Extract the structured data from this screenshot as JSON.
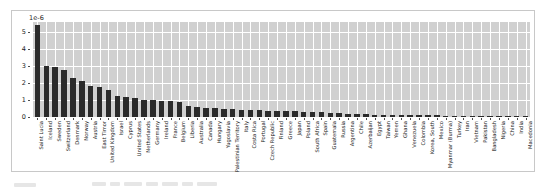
{
  "chart_data": {
    "type": "bar",
    "title": "",
    "xlabel": "",
    "ylabel": "",
    "exponent_label": "1e-6",
    "scale_factor": 1e-06,
    "ylim": [
      0,
      5.6
    ],
    "yticks": [
      0,
      1,
      2,
      3,
      4,
      5
    ],
    "ytick_labels": [
      "0",
      "1",
      "2",
      "3",
      "4",
      "5"
    ],
    "grid": true,
    "legend": "none",
    "categories": [
      "Saint Lucia",
      "Iceland",
      "Sweden",
      "Switzerland",
      "Denmark",
      "Norway",
      "Austria",
      "East Timor",
      "United Kingdom",
      "Israel",
      "Cyprus",
      "United States",
      "Netherlands",
      "Germany",
      "Ireland",
      "France",
      "Belgium",
      "Liberia",
      "Australia",
      "Canada",
      "Hungary",
      "Yugoslavia",
      "Palestinian Territory",
      "Italy",
      "Costa Rica",
      "Portugal",
      "Czech Republic",
      "Finland",
      "Greece",
      "Japan",
      "Poland",
      "South Africa",
      "Spain",
      "Guatemala",
      "Russia",
      "Argentina",
      "Chile",
      "Azerbaijan",
      "Egypt",
      "Taiwan",
      "Yemen",
      "Ghana",
      "Venezuela",
      "Colombia",
      "Korea, South",
      "Mexico",
      "Myanmar (Burma)",
      "Turkey",
      "Iran",
      "Vietnam",
      "Pakistan",
      "Bangladesh",
      "Nigeria",
      "China",
      "India",
      "Macedonia"
    ],
    "values": [
      5.45,
      3.02,
      2.95,
      2.8,
      2.3,
      2.15,
      1.8,
      1.76,
      1.6,
      1.24,
      1.2,
      1.12,
      1.02,
      1.0,
      0.95,
      0.92,
      0.9,
      0.62,
      0.58,
      0.55,
      0.52,
      0.5,
      0.46,
      0.44,
      0.42,
      0.4,
      0.38,
      0.36,
      0.34,
      0.33,
      0.32,
      0.3,
      0.29,
      0.22,
      0.21,
      0.2,
      0.19,
      0.18,
      0.13,
      0.12,
      0.12,
      0.11,
      0.1,
      0.1,
      0.09,
      0.09,
      0.08,
      0.08,
      0.07,
      0.06,
      0.05,
      0.05,
      0.04,
      0.04,
      0.03,
      0.02
    ],
    "colors": {
      "bar": "#2b2b2b",
      "plot_background": "#d0d0d0",
      "gridline": "#ffffff",
      "figure_background": "#ffffff",
      "frame": "#c8c8c8",
      "tick_text": "#1a1a1a"
    }
  }
}
